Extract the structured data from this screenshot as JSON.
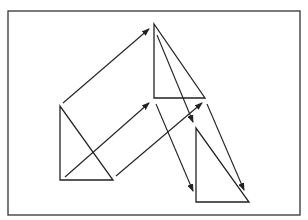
{
  "diagram": {
    "colors": {
      "stroke": "#222222",
      "background": "#ffffff",
      "frame": "#333333"
    },
    "frame": {
      "x": 8,
      "y": 11,
      "width": 292,
      "height": 204
    },
    "triangles": [
      {
        "name": "original",
        "points": [
          [
            60,
            106
          ],
          [
            60,
            180
          ],
          [
            113,
            180
          ]
        ]
      },
      {
        "name": "first-image",
        "points": [
          [
            154,
            24
          ],
          [
            154,
            98
          ],
          [
            205,
            98
          ]
        ]
      },
      {
        "name": "second-image",
        "points": [
          [
            196,
            128
          ],
          [
            196,
            202
          ],
          [
            249,
            202
          ]
        ]
      }
    ],
    "arrows": [
      {
        "name": "arrow-apex-1",
        "from": [
          63,
          103
        ],
        "to": [
          149,
          29
        ]
      },
      {
        "name": "arrow-bottom-left-1",
        "from": [
          65,
          177
        ],
        "to": [
          149,
          103
        ]
      },
      {
        "name": "arrow-bottom-right-1",
        "from": [
          116,
          176
        ],
        "to": [
          202,
          103
        ]
      },
      {
        "name": "arrow-apex-2",
        "from": [
          157,
          35
        ],
        "to": [
          193,
          122
        ]
      },
      {
        "name": "arrow-bottom-left-2",
        "from": [
          156,
          104
        ],
        "to": [
          193,
          191
        ]
      },
      {
        "name": "arrow-bottom-right-2",
        "from": [
          207,
          104
        ],
        "to": [
          244,
          190
        ]
      }
    ]
  }
}
